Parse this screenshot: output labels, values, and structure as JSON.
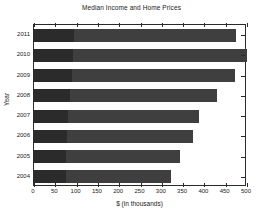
{
  "chart_data": {
    "type": "bar",
    "orientation": "horizontal",
    "stacked": true,
    "title": "Median Income and Home Prices",
    "xlabel": "$ (in thousands)",
    "ylabel": "Year",
    "categories": [
      "2011",
      "2010",
      "2009",
      "2008",
      "2007",
      "2006",
      "2005",
      "2004"
    ],
    "series": [
      {
        "name": "Median Income",
        "color": "#2b2b2b",
        "values": [
          93,
          92,
          89,
          84,
          79,
          77,
          76,
          74
        ]
      },
      {
        "name": "Median Home Price",
        "color": "#3f3f3f",
        "values": [
          381,
          408,
          383,
          346,
          309,
          296,
          267,
          248
        ]
      }
    ],
    "totals": [
      474,
      500,
      472,
      430,
      388,
      373,
      343,
      322
    ],
    "xlim": [
      0,
      500
    ],
    "xticks": [
      0,
      50,
      100,
      150,
      200,
      250,
      300,
      350,
      400,
      450,
      500
    ],
    "xticklabels": [
      "0",
      "50",
      "100",
      "150",
      "200",
      "250",
      "300",
      "350",
      "400",
      "450",
      "500"
    ],
    "grid": false,
    "legend": null,
    "box": true
  },
  "figure": {
    "background_color": "#ffffff",
    "axis_color": "#2a2a2a",
    "text_color": "#1a1a1a"
  }
}
